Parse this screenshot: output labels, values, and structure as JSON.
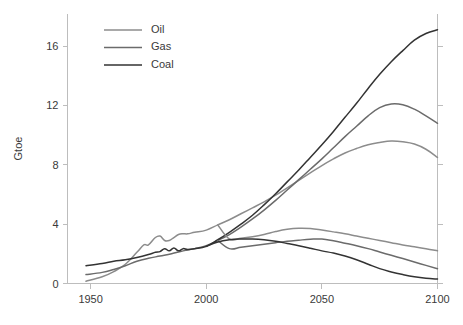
{
  "chart_data": {
    "type": "line",
    "title": "",
    "subtitle": "",
    "xlabel": "",
    "ylabel": "Gtoe",
    "xlim": [
      1940,
      2100
    ],
    "ylim": [
      0,
      18.2
    ],
    "xticks": [
      1950,
      2000,
      2050,
      2100
    ],
    "yticks": [
      0,
      4,
      8,
      12,
      16
    ],
    "xtick_labels": [
      "1950",
      "2000",
      "2050",
      "2100"
    ],
    "ytick_labels": [
      "0",
      "4",
      "8",
      "12",
      "16"
    ],
    "grid": false,
    "legend_position": "top-left",
    "legend": [
      "Oil",
      "Gas",
      "Coal"
    ],
    "colors": {
      "oil": "#8c8c8c",
      "gas": "#6b6b6b",
      "coal": "#333333",
      "axis": "#bdbdbd",
      "text": "#3a3a3a",
      "background": "#ffffff"
    },
    "note": "Two scenario branches per fuel: a high (rising) branch and a low (declining) branch; branches separate around 2005-2010.",
    "series": [
      {
        "name": "Oil",
        "branch": "high",
        "color": "#8c8c8c",
        "x": [
          1948,
          1955,
          1960,
          1965,
          1970,
          1973,
          1975,
          1978,
          1980,
          1982,
          1984,
          1986,
          1988,
          1990,
          1992,
          1995,
          2000,
          2005,
          2010,
          2015,
          2020,
          2025,
          2030,
          2035,
          2040,
          2045,
          2050,
          2055,
          2060,
          2065,
          2070,
          2075,
          2080,
          2085,
          2090,
          2095,
          2100
        ],
        "y": [
          0.15,
          0.45,
          0.8,
          1.3,
          2.1,
          2.6,
          2.6,
          3.1,
          3.2,
          2.9,
          2.9,
          3.1,
          3.3,
          3.35,
          3.35,
          3.45,
          3.6,
          3.95,
          4.3,
          4.7,
          5.1,
          5.5,
          5.95,
          6.45,
          6.95,
          7.45,
          7.95,
          8.4,
          8.8,
          9.1,
          9.35,
          9.5,
          9.6,
          9.55,
          9.4,
          9.05,
          8.5
        ]
      },
      {
        "name": "Gas",
        "branch": "high",
        "color": "#6b6b6b",
        "x": [
          1948,
          1955,
          1960,
          1965,
          1970,
          1975,
          1980,
          1985,
          1990,
          1995,
          2000,
          2005,
          2010,
          2015,
          2020,
          2025,
          2030,
          2035,
          2040,
          2045,
          2050,
          2055,
          2060,
          2065,
          2070,
          2075,
          2080,
          2085,
          2090,
          2095,
          2100
        ],
        "y": [
          0.6,
          0.75,
          0.95,
          1.2,
          1.5,
          1.7,
          1.85,
          2.0,
          2.2,
          2.35,
          2.55,
          2.9,
          3.3,
          3.8,
          4.35,
          4.95,
          5.6,
          6.3,
          7.0,
          7.7,
          8.4,
          9.15,
          9.9,
          10.6,
          11.3,
          11.85,
          12.1,
          12.05,
          11.75,
          11.3,
          10.8
        ]
      },
      {
        "name": "Coal",
        "branch": "high",
        "color": "#333333",
        "x": [
          1948,
          1955,
          1960,
          1965,
          1970,
          1975,
          1978,
          1980,
          1982,
          1984,
          1986,
          1988,
          1990,
          1992,
          1995,
          2000,
          2005,
          2010,
          2015,
          2020,
          2025,
          2030,
          2035,
          2040,
          2045,
          2050,
          2055,
          2060,
          2065,
          2070,
          2075,
          2080,
          2085,
          2090,
          2095,
          2100
        ],
        "y": [
          1.2,
          1.35,
          1.5,
          1.6,
          1.75,
          1.95,
          2.1,
          2.15,
          2.35,
          2.2,
          2.4,
          2.2,
          2.35,
          2.3,
          2.35,
          2.5,
          2.95,
          3.45,
          4.0,
          4.6,
          5.3,
          6.05,
          6.85,
          7.65,
          8.5,
          9.35,
          10.25,
          11.2,
          12.15,
          13.15,
          14.1,
          14.95,
          15.7,
          16.4,
          16.85,
          17.1
        ]
      },
      {
        "name": "Oil",
        "branch": "low",
        "color": "#8c8c8c",
        "x": [
          2005,
          2010,
          2015,
          2020,
          2025,
          2030,
          2035,
          2040,
          2045,
          2050,
          2055,
          2060,
          2065,
          2070,
          2075,
          2080,
          2085,
          2090,
          2095,
          2100
        ],
        "y": [
          3.95,
          3.0,
          3.05,
          3.15,
          3.3,
          3.5,
          3.65,
          3.72,
          3.7,
          3.6,
          3.48,
          3.35,
          3.2,
          3.05,
          2.9,
          2.75,
          2.6,
          2.48,
          2.35,
          2.2
        ]
      },
      {
        "name": "Gas",
        "branch": "low",
        "color": "#6b6b6b",
        "x": [
          2005,
          2010,
          2015,
          2020,
          2025,
          2030,
          2035,
          2040,
          2045,
          2050,
          2055,
          2060,
          2065,
          2070,
          2075,
          2080,
          2085,
          2090,
          2095,
          2100
        ],
        "y": [
          2.9,
          2.35,
          2.45,
          2.55,
          2.65,
          2.75,
          2.85,
          2.92,
          2.98,
          3.0,
          2.88,
          2.72,
          2.55,
          2.35,
          2.12,
          1.9,
          1.68,
          1.45,
          1.22,
          1.0
        ]
      },
      {
        "name": "Coal",
        "branch": "low",
        "color": "#333333",
        "x": [
          2000,
          2005,
          2010,
          2015,
          2020,
          2025,
          2030,
          2035,
          2040,
          2045,
          2050,
          2055,
          2060,
          2065,
          2070,
          2075,
          2080,
          2085,
          2090,
          2095,
          2100
        ],
        "y": [
          2.5,
          2.8,
          2.95,
          3.0,
          3.0,
          2.95,
          2.85,
          2.7,
          2.55,
          2.38,
          2.2,
          2.05,
          1.85,
          1.6,
          1.3,
          1.0,
          0.78,
          0.6,
          0.45,
          0.35,
          0.3
        ]
      }
    ]
  },
  "legend": {
    "items": [
      {
        "label": "Oil",
        "color": "#8c8c8c"
      },
      {
        "label": "Gas",
        "color": "#6b6b6b"
      },
      {
        "label": "Coal",
        "color": "#333333"
      }
    ]
  },
  "axes": {
    "y_title": "Gtoe"
  }
}
